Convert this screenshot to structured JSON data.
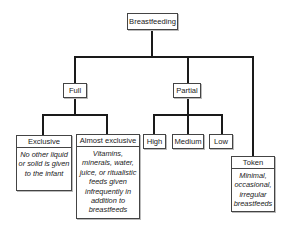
{
  "diagram": {
    "root": {
      "label": "Breastfeeding"
    },
    "categories": [
      {
        "label": "Full",
        "children": [
          {
            "label": "Exclusive",
            "description": "No other liquid or solid is given to the infant"
          },
          {
            "label": "Almost exclusive",
            "description": "Vitamins, minerals, water, juice, or ritualistic feeds given infrequently in addition to breastfeeds"
          }
        ]
      },
      {
        "label": "Partial",
        "children": [
          {
            "label": "High"
          },
          {
            "label": "Medium"
          },
          {
            "label": "Low"
          }
        ]
      },
      {
        "label": "Token",
        "description": "Minimal, occasional, irregular breastfeeds"
      }
    ],
    "line_color": "#1a1a1a",
    "box_border_color": "#444444"
  }
}
